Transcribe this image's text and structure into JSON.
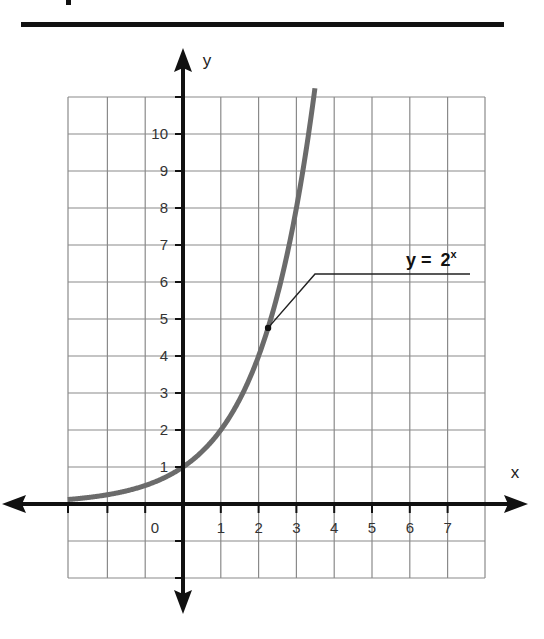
{
  "chart_data": {
    "type": "line",
    "title": "",
    "xlabel": "x",
    "ylabel": "y",
    "x_ticks": [
      "0",
      "1",
      "2",
      "3",
      "4",
      "5",
      "6",
      "7"
    ],
    "y_ticks": [
      "1",
      "2",
      "3",
      "4",
      "5",
      "6",
      "7",
      "8",
      "9",
      "10"
    ],
    "xlim": [
      -3,
      8
    ],
    "ylim": [
      -2,
      11
    ],
    "grid": true,
    "series": [
      {
        "name": "y = 2^x",
        "function": "2^x",
        "x": [
          -3,
          -2,
          -1,
          0,
          1,
          2,
          3,
          3.4
        ],
        "values": [
          0.125,
          0.25,
          0.5,
          1,
          2,
          4,
          8,
          10.56
        ],
        "color": "#6b6b6b"
      }
    ],
    "annotations": [
      {
        "text_base": "y = ",
        "text_base_num": "2",
        "text_sup": "x",
        "point": [
          2.25,
          4.76
        ]
      }
    ]
  },
  "colors": {
    "curve": "#6b6b6b",
    "axis": "#111111",
    "grid": "#8a8a8a"
  }
}
